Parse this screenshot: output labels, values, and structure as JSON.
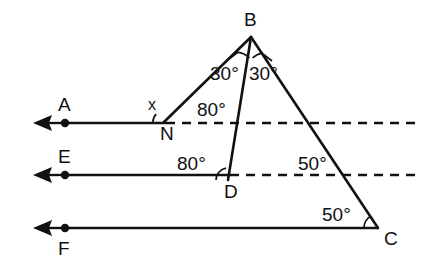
{
  "figure": {
    "background_color": "#ffffff",
    "stroke_color": "#111111",
    "width": 425,
    "height": 273
  },
  "points": [
    {
      "name": "B",
      "label": "B",
      "x": 251,
      "y": 35,
      "label_x": 244,
      "label_y": 26,
      "dot": false
    },
    {
      "name": "N",
      "label": "N",
      "x": 164,
      "y": 122,
      "label_x": 160,
      "label_y": 140,
      "dot": false
    },
    {
      "name": "D",
      "label": "D",
      "x": 228,
      "y": 180,
      "label_x": 224,
      "label_y": 198,
      "dot": false
    },
    {
      "name": "C",
      "label": "C",
      "x": 378,
      "y": 228,
      "label_x": 384,
      "label_y": 245,
      "dot": false
    },
    {
      "name": "A",
      "label": "A",
      "x": 65,
      "y": 123,
      "label_x": 58,
      "label_y": 111,
      "dot": true
    },
    {
      "name": "E",
      "label": "E",
      "x": 65,
      "y": 175,
      "label_x": 58,
      "label_y": 163,
      "dot": true
    },
    {
      "name": "F",
      "label": "F",
      "x": 65,
      "y": 228,
      "label_x": 58,
      "label_y": 255,
      "dot": true
    }
  ],
  "rays": [
    {
      "name": "ray-A-left",
      "from_x": 64,
      "from_y": 123,
      "to_x": 36,
      "to_y": 123,
      "arrow": "left"
    },
    {
      "name": "ray-E-left",
      "from_x": 64,
      "from_y": 175,
      "to_x": 36,
      "to_y": 175,
      "arrow": "left"
    },
    {
      "name": "ray-F-left",
      "from_x": 64,
      "from_y": 228,
      "to_x": 36,
      "to_y": 228,
      "arrow": "left"
    }
  ],
  "segments": [
    {
      "name": "segment-A-to-N",
      "x1": 64,
      "y1": 123,
      "x2": 166,
      "y2": 123,
      "style": "solid"
    },
    {
      "name": "segment-E-to-D",
      "x1": 64,
      "y1": 175,
      "x2": 230,
      "y2": 175,
      "style": "solid"
    },
    {
      "name": "segment-F-to-C",
      "x1": 64,
      "y1": 228,
      "x2": 379,
      "y2": 228,
      "style": "solid"
    },
    {
      "name": "segment-B-to-N",
      "x1": 251,
      "y1": 37,
      "x2": 164,
      "y2": 122,
      "style": "triangle"
    },
    {
      "name": "segment-B-to-D",
      "x1": 251,
      "y1": 37,
      "x2": 228,
      "y2": 180,
      "style": "triangle"
    },
    {
      "name": "segment-B-to-C",
      "x1": 251,
      "y1": 37,
      "x2": 378,
      "y2": 228,
      "style": "triangle"
    },
    {
      "name": "dashed-from-N",
      "x1": 166,
      "y1": 123,
      "x2": 416,
      "y2": 123,
      "style": "dashed"
    },
    {
      "name": "dashed-from-D",
      "x1": 230,
      "y1": 175,
      "x2": 416,
      "y2": 175,
      "style": "dashed"
    }
  ],
  "angle_labels": [
    {
      "name": "angle-x-at-N",
      "text": "x",
      "x": 148,
      "y": 110,
      "size": "small"
    },
    {
      "name": "angle-30-left-at-B",
      "text": "30°",
      "x": 210,
      "y": 80,
      "size": "normal"
    },
    {
      "name": "angle-30-right-at-B",
      "text": "30°",
      "x": 249,
      "y": 80,
      "size": "normal"
    },
    {
      "name": "angle-80-at-N",
      "text": "80°",
      "x": 197,
      "y": 116,
      "size": "normal"
    },
    {
      "name": "angle-80-at-D",
      "text": "80°",
      "x": 177,
      "y": 170,
      "size": "normal"
    },
    {
      "name": "angle-50-upper-on-BC",
      "text": "50°",
      "x": 298,
      "y": 170,
      "size": "normal"
    },
    {
      "name": "angle-50-at-C",
      "text": "50°",
      "x": 322,
      "y": 221,
      "size": "normal"
    }
  ],
  "angle_arcs": [
    {
      "name": "arc-at-N-x",
      "cx": 164,
      "cy": 122,
      "r": 11,
      "start_deg": 180,
      "end_deg": 135
    },
    {
      "name": "arc-at-B-left",
      "cx": 251,
      "cy": 37,
      "r": 21,
      "start_deg": 225,
      "end_deg": 266
    },
    {
      "name": "arc-at-B-right",
      "cx": 251,
      "cy": 37,
      "r": 21,
      "start_deg": 274,
      "end_deg": 304
    },
    {
      "name": "arc-at-D",
      "cx": 228,
      "cy": 180,
      "r": 12,
      "start_deg": 180,
      "end_deg": 99
    },
    {
      "name": "arc-at-C",
      "cx": 378,
      "cy": 228,
      "r": 14,
      "start_deg": 180,
      "end_deg": 124
    }
  ],
  "tick_marks": [
    {
      "name": "tick-b-left",
      "x1": 229,
      "y1": 59,
      "x2": 237,
      "y2": 53
    },
    {
      "name": "tick-b-right",
      "x1": 263,
      "y1": 55,
      "x2": 271,
      "y2": 61
    }
  ],
  "measures": {
    "angle_BNA": "x",
    "angle_BNright": "80°",
    "angle_NBD": "30°",
    "angle_DBC": "30°",
    "angle_BDE_side": "80°",
    "angle_BC_with_dashed": "50°",
    "angle_BCF": "50°"
  }
}
